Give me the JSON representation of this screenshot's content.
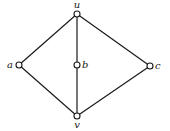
{
  "diagram": {
    "type": "graph",
    "nodes": [
      {
        "id": "u",
        "label": "u",
        "x": 77,
        "y": 14,
        "lx": 77,
        "ly": 8,
        "anchor": "middle"
      },
      {
        "id": "a",
        "label": "a",
        "x": 19,
        "y": 65,
        "lx": 13,
        "ly": 68,
        "anchor": "end"
      },
      {
        "id": "b",
        "label": "b",
        "x": 77,
        "y": 65,
        "lx": 82,
        "ly": 68,
        "anchor": "start"
      },
      {
        "id": "c",
        "label": "c",
        "x": 150,
        "y": 66,
        "lx": 155,
        "ly": 69,
        "anchor": "start"
      },
      {
        "id": "v",
        "label": "v",
        "x": 77,
        "y": 116,
        "lx": 77,
        "ly": 128,
        "anchor": "middle"
      }
    ],
    "edges": [
      {
        "from": "u",
        "to": "a"
      },
      {
        "from": "u",
        "to": "b"
      },
      {
        "from": "u",
        "to": "c"
      },
      {
        "from": "a",
        "to": "v"
      },
      {
        "from": "b",
        "to": "v"
      },
      {
        "from": "c",
        "to": "v"
      }
    ],
    "colors": {
      "stroke": "#1a1a1a",
      "background": "#ffffff"
    }
  }
}
